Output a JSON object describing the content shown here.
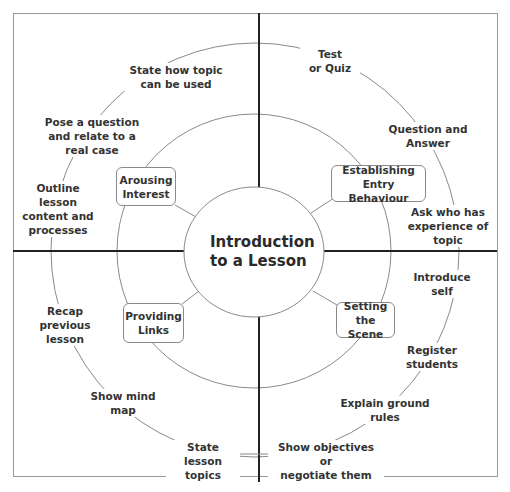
{
  "diagram": {
    "title": "Introduction to a Lesson",
    "center_label": "Introduction\nto a Lesson",
    "colors": {
      "axis": "#222222",
      "circle": "#8a8a8a",
      "text": "#333333",
      "frame": "#9a9a9a"
    },
    "quadrants": [
      {
        "id": "arousing-interest",
        "label": "Arousing\nInterest",
        "items": [
          "State how topic\ncan be used",
          "Pose a question\nand relate to a\nreal case",
          "Outline lesson\ncontent and\nprocesses"
        ]
      },
      {
        "id": "establishing-entry-behaviour",
        "label": "Establishing\nEntry Behaviour",
        "items": [
          "Test\nor Quiz",
          "Question and\nAnswer",
          "Ask who has\nexperience of\ntopic"
        ]
      },
      {
        "id": "setting-the-scene",
        "label": "Setting\nthe Scene",
        "items": [
          "Introduce\nself",
          "Register\nstudents",
          "Explain ground\nrules",
          "Show objectives or\nnegotiate them"
        ]
      },
      {
        "id": "providing-links",
        "label": "Providing\nLinks",
        "items": [
          "Recap previous\nlesson",
          "Show mind map",
          "State lesson\ntopics"
        ]
      }
    ]
  }
}
